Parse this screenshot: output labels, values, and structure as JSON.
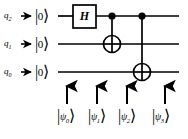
{
  "diagram": {
    "background_color": "#ffffff",
    "ink_color": "#000000"
  },
  "qubits": [
    {
      "id": "q2",
      "label": "q",
      "subscript": "2",
      "init_state": "0",
      "wire_y": 16
    },
    {
      "id": "q1",
      "label": "q",
      "subscript": "1",
      "init_state": "0",
      "wire_y": 44
    },
    {
      "id": "q0",
      "label": "q",
      "subscript": "0",
      "init_state": "0",
      "wire_y": 72
    }
  ],
  "ket_bar": "|",
  "ket_angle": "⟩",
  "gates": [
    {
      "name": "hadamard",
      "symbol": "H",
      "type": "box",
      "target_wire": "q2",
      "x": 84,
      "box_width": 23,
      "box_height": 23
    },
    {
      "name": "cnot-q2-q1",
      "symbol": "CNOT",
      "type": "cnot",
      "control_wire": "q2",
      "target_wire": "q1",
      "x": 112
    },
    {
      "name": "cnot-q2-q0",
      "symbol": "CNOT",
      "type": "cnot",
      "control_wire": "q2",
      "target_wire": "q0",
      "x": 142
    }
  ],
  "wire_start_x": 58,
  "wire_end_x": 179,
  "state_markers": [
    {
      "name": "psi0",
      "psi": "ψ",
      "subscript": "0",
      "arrow_x": 67,
      "label_x": 57
    },
    {
      "name": "psi1",
      "psi": "ψ",
      "subscript": "1",
      "arrow_x": 97,
      "label_x": 88
    },
    {
      "name": "psi2",
      "psi": "ψ",
      "subscript": "2",
      "arrow_x": 127,
      "label_x": 118
    },
    {
      "name": "psi3",
      "psi": "ψ",
      "subscript": "3",
      "arrow_x": 165,
      "label_x": 152
    }
  ],
  "arrow": {
    "name": "up-arrow",
    "top_y": 85,
    "bottom_y": 104
  }
}
